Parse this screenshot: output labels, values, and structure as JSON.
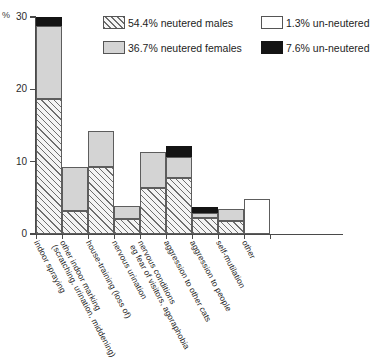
{
  "chart_data": {
    "type": "bar",
    "title": "",
    "subtitle": "",
    "xlabel": "",
    "ylabel": "%",
    "ylim": [
      0,
      30
    ],
    "yticks": [
      0,
      10,
      20,
      30
    ],
    "ytick_labels": [
      "0",
      "10",
      "20",
      "30"
    ],
    "grid": false,
    "stacked": true,
    "legend_position": "top-right",
    "categories": [
      "indoor spraying",
      "other indoor marking (scratching, urination, middening)",
      "house-training (loss of)",
      "nervous urination",
      "nervous conditions eg fear of visitors, agoraphobia",
      "aggression to other cats",
      "aggression to people",
      "self-mutilation",
      "other"
    ],
    "category_lines": [
      [
        "indoor spraying"
      ],
      [
        "other indoor marking",
        "(scratching, urination, middening)"
      ],
      [
        "house-training (loss of)"
      ],
      [
        "nervous urination"
      ],
      [
        "nervous conditions",
        "eg fear of visitors, agoraphobia"
      ],
      [
        "aggression to other cats"
      ],
      [
        "aggression to people"
      ],
      [
        "self-mutilation"
      ],
      [
        "other"
      ]
    ],
    "series": [
      {
        "name": "54.4% neutered males",
        "pattern": "hatched",
        "color": "#f4f4f4",
        "values": [
          18.6,
          3.2,
          9.2,
          2.1,
          6.4,
          7.8,
          2.2,
          1.8,
          0.0
        ]
      },
      {
        "name": "36.7% neutered females",
        "pattern": "solid",
        "color": "#d4d4d4",
        "values": [
          10.2,
          6.1,
          5.0,
          1.8,
          5.0,
          2.9,
          0.7,
          1.7,
          0.0
        ]
      },
      {
        "name": "7.6% un-neutered",
        "pattern": "solid",
        "color": "#141414",
        "values": [
          1.2,
          0.0,
          0.0,
          0.0,
          0.0,
          1.4,
          0.8,
          0.0,
          0.0
        ]
      },
      {
        "name": "1.3% un-neutered",
        "pattern": "solid",
        "color": "#ffffff",
        "values": [
          0.0,
          0.0,
          0.0,
          0.0,
          0.0,
          0.0,
          0.0,
          0.0,
          4.9
        ]
      }
    ],
    "totals": [
      30.0,
      9.3,
      14.2,
      3.9,
      11.4,
      12.1,
      3.7,
      3.5,
      4.9
    ]
  },
  "legend": {
    "items": [
      {
        "label": "54.4% neutered males",
        "swatch": "hatched-swatch"
      },
      {
        "label": "1.3% un-neutered",
        "swatch": "white-swatch"
      },
      {
        "label": "36.7% neutered females",
        "swatch": "light-gray-swatch"
      },
      {
        "label": "7.6% un-neutered",
        "swatch": "black-swatch"
      }
    ]
  },
  "axes": {
    "y_unit_label": "%",
    "ytick_labels": [
      "30",
      "20",
      "10",
      "0"
    ]
  }
}
